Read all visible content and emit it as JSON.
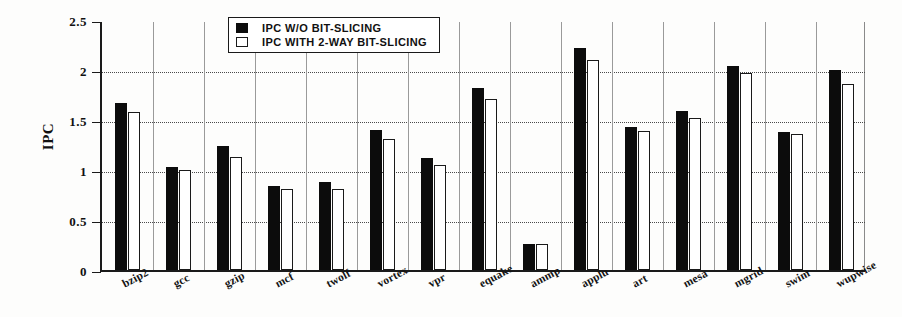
{
  "chart_data": {
    "type": "bar",
    "title": "",
    "xlabel": "",
    "ylabel": "IPC",
    "ylim": [
      0,
      2.5
    ],
    "ytick_labels": [
      "0",
      "0.5",
      "1",
      "1.5",
      "2",
      "2.5"
    ],
    "ytick_values": [
      0,
      0.5,
      1,
      1.5,
      2,
      2.5
    ],
    "grid": true,
    "legend_position": "top-center",
    "categories": [
      "bzip2",
      "gcc",
      "gzip",
      "mcf",
      "twolf",
      "vortex",
      "vpr",
      "equake",
      "ammp",
      "applu",
      "art",
      "mesa",
      "mgrid",
      "swim",
      "wupwise"
    ],
    "series": [
      {
        "name": "IPC W/O BIT-SLICING",
        "color": "#0c0c0c",
        "values": [
          1.67,
          1.03,
          1.24,
          0.84,
          0.88,
          1.4,
          1.12,
          1.82,
          0.26,
          2.22,
          1.43,
          1.59,
          2.04,
          1.38,
          2.0
        ]
      },
      {
        "name": "IPC WITH 2-WAY BIT-SLICING",
        "color": "#ffffff",
        "values": [
          1.58,
          1.0,
          1.13,
          0.81,
          0.81,
          1.31,
          1.05,
          1.71,
          0.26,
          2.1,
          1.39,
          1.52,
          1.97,
          1.36,
          1.86
        ]
      }
    ]
  },
  "legend": {
    "items": [
      {
        "label": "IPC W/O BIT-SLICING",
        "swatch": "filled-square"
      },
      {
        "label": "IPC WITH 2-WAY BIT-SLICING",
        "swatch": "empty-square"
      }
    ]
  },
  "axes": {
    "y_axis_title": "IPC"
  }
}
